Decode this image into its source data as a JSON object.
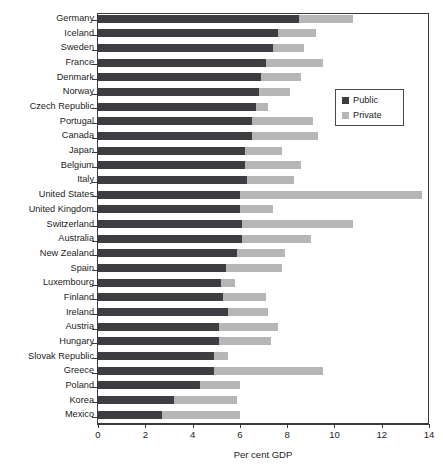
{
  "chart_data": {
    "type": "bar",
    "orientation": "horizontal",
    "stacked": true,
    "title": "",
    "xlabel": "Per cent GDP",
    "ylabel": "",
    "xlim": [
      0,
      14
    ],
    "xticks": [
      0,
      2,
      4,
      6,
      8,
      10,
      12,
      14
    ],
    "grid": false,
    "legend_position": "upper right",
    "colors": {
      "public": "#3d3d42",
      "private": "#b6b6b6"
    },
    "categories": [
      "Germany",
      "Iceland",
      "Sweden",
      "France",
      "Denmark",
      "Norway",
      "Czech Republic",
      "Portugal",
      "Canada",
      "Japan",
      "Belgium",
      "Italy",
      "United States",
      "United Kingdom",
      "Switzerland",
      "Australia",
      "New Zealand",
      "Spain",
      "Luxembourg",
      "Finland",
      "Ireland",
      "Austria",
      "Hungary",
      "Slovak Republic",
      "Greece",
      "Poland",
      "Korea",
      "Mexico"
    ],
    "series": [
      {
        "name": "Public",
        "values": [
          8.5,
          7.6,
          7.4,
          7.1,
          6.9,
          6.8,
          6.7,
          6.5,
          6.5,
          6.2,
          6.2,
          6.3,
          6.0,
          6.0,
          6.1,
          6.1,
          5.9,
          5.4,
          5.2,
          5.3,
          5.5,
          5.1,
          5.1,
          4.9,
          4.9,
          4.3,
          3.2,
          2.7
        ]
      },
      {
        "name": "Private",
        "values": [
          2.3,
          1.6,
          1.3,
          2.4,
          1.7,
          1.3,
          0.5,
          2.6,
          2.8,
          1.6,
          2.4,
          2.0,
          7.7,
          1.4,
          4.7,
          2.9,
          2.0,
          2.4,
          0.6,
          1.8,
          1.7,
          2.5,
          2.2,
          0.6,
          4.6,
          1.7,
          2.7,
          3.3
        ]
      }
    ],
    "totals": [
      10.8,
      9.2,
      8.7,
      9.5,
      8.6,
      8.1,
      7.2,
      9.1,
      9.3,
      7.8,
      8.6,
      8.3,
      13.7,
      7.4,
      10.8,
      9.0,
      7.9,
      7.8,
      5.8,
      7.1,
      7.2,
      7.6,
      7.3,
      5.5,
      9.5,
      6.0,
      5.9,
      6.0
    ]
  },
  "legend": {
    "items": [
      {
        "label": "Public",
        "color": "#3d3d42"
      },
      {
        "label": "Private",
        "color": "#b6b6b6"
      }
    ]
  },
  "axis": {
    "x_title": "Per cent GDP",
    "x_tick_labels": [
      "0",
      "2",
      "4",
      "6",
      "8",
      "10",
      "12",
      "14"
    ]
  },
  "title_remnant": ""
}
